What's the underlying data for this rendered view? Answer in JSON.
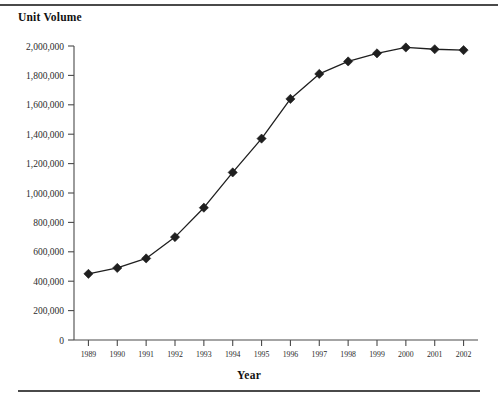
{
  "page": {
    "top_cropped_text": "",
    "x_axis_title": "Year"
  },
  "chart_data": {
    "type": "line",
    "title": "Unit Volume",
    "xlabel": "Year",
    "ylabel": "",
    "grid": false,
    "legend": null,
    "marker": "diamond",
    "line_color": "#1f1f1f",
    "marker_color": "#1f1f1f",
    "xlim": [
      1989,
      2002
    ],
    "ylim": [
      0,
      2000000
    ],
    "ytick_step": 200000,
    "categories": [
      "1989",
      "1990",
      "1991",
      "1992",
      "1993",
      "1994",
      "1995",
      "1996",
      "1997",
      "1998",
      "1999",
      "2000",
      "2001",
      "2002"
    ],
    "ytick_labels": [
      "0",
      "200,000",
      "400,000",
      "600,000",
      "800,000",
      "1,000,000",
      "1,200,000",
      "1,400,000",
      "1,600,000",
      "1,800,000",
      "2,000,000"
    ],
    "ytick_values": [
      0,
      200000,
      400000,
      600000,
      800000,
      1000000,
      1200000,
      1400000,
      1600000,
      1800000,
      2000000
    ],
    "values": [
      450000,
      490000,
      555000,
      700000,
      900000,
      1140000,
      1370000,
      1640000,
      1810000,
      1895000,
      1950000,
      1990000,
      1978000,
      1972000
    ],
    "series": [
      {
        "name": "Unit Volume",
        "values": [
          450000,
          490000,
          555000,
          700000,
          900000,
          1140000,
          1370000,
          1640000,
          1810000,
          1895000,
          1950000,
          1990000,
          1978000,
          1972000
        ]
      }
    ]
  }
}
